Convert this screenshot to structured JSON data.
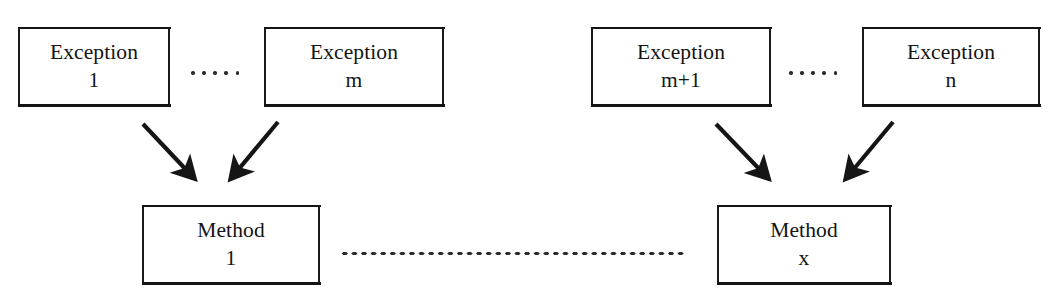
{
  "diagram": {
    "background_color": "#ffffff",
    "stroke_color": "#151515",
    "nodes": {
      "exception_1": {
        "line1": "Exception",
        "line2": "1"
      },
      "exception_m": {
        "line1": "Exception",
        "line2": "m"
      },
      "exception_m_plus_1": {
        "line1": "Exception",
        "line2": "m+1"
      },
      "exception_n": {
        "line1": "Exception",
        "line2": "n"
      },
      "method_1": {
        "line1": "Method",
        "line2": "1"
      },
      "method_x": {
        "line1": "Method",
        "line2": "x"
      }
    },
    "ellipses": {
      "exceptions_left": {
        "glyph": "·····",
        "dot_count": 5
      },
      "exceptions_right": {
        "glyph": "·····",
        "dot_count": 5
      },
      "methods": {
        "glyph": "····································",
        "dot_count": 36
      }
    },
    "edges": [
      {
        "from": "exception_1",
        "to": "method_1",
        "kind": "arrow"
      },
      {
        "from": "exception_m",
        "to": "method_1",
        "kind": "arrow"
      },
      {
        "from": "exception_m_plus_1",
        "to": "method_x",
        "kind": "arrow"
      },
      {
        "from": "exception_n",
        "to": "method_x",
        "kind": "arrow"
      }
    ]
  }
}
